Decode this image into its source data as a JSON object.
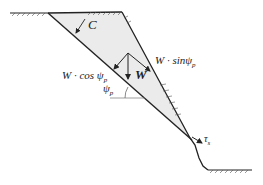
{
  "diagram": {
    "labels": {
      "cohesion": "C",
      "weight": "W",
      "w_cos": "W · cos",
      "w_sin": "W · sin",
      "psi": "ψ",
      "psi_sub": "p",
      "tau": "τ",
      "tau_sub": "s"
    },
    "colors": {
      "wedge_fill": "#ebebeb",
      "line": "#222222"
    }
  }
}
